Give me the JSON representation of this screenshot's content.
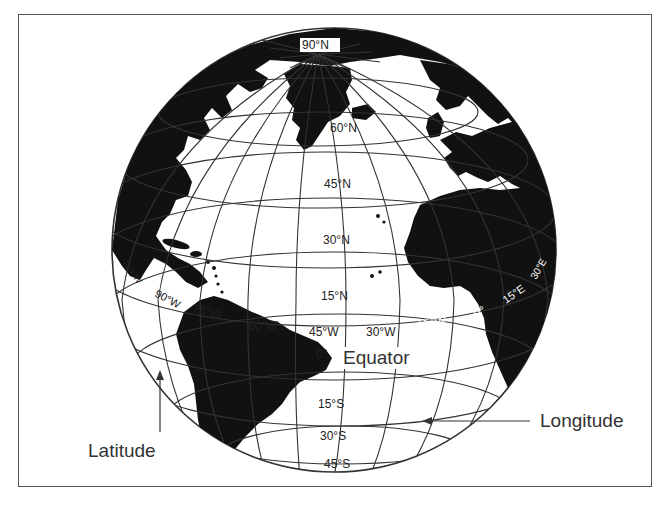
{
  "figure": {
    "type": "globe-diagram"
  },
  "colors": {
    "land": "#111111",
    "ocean": "#ffffff",
    "grid": "#333333",
    "frame": "#555555",
    "label": "#222222"
  },
  "latitude_labels": {
    "n90": "90°N",
    "n60": "60°N",
    "n45": "45°N",
    "n30": "30°N",
    "n15": "15°N",
    "eq": "0°",
    "s15": "15°S",
    "s30": "30°S",
    "s45": "45°S"
  },
  "longitude_labels": {
    "w105": "105°W",
    "w90": "90°W",
    "w75": "75°W",
    "w60": "60°W",
    "w45": "45°W",
    "w30": "30°W",
    "w15": "15°W",
    "p0": "0°",
    "e15": "15°E",
    "e30": "30°E"
  },
  "annotations": {
    "equator": "Equator",
    "latitude": "Latitude",
    "longitude": "Longitude"
  }
}
